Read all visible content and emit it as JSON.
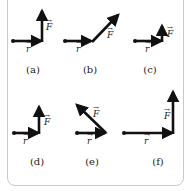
{
  "figure": {
    "colors": {
      "arrow": "#111111",
      "label": "#222222",
      "border": "#c8c8c8",
      "background": "#ffffff"
    },
    "labels": {
      "r": "r",
      "F": "F"
    },
    "panels": [
      {
        "id": "a",
        "caption": "(a)",
        "description": "F perpendicular to r, pointing up, long"
      },
      {
        "id": "b",
        "caption": "(b)",
        "description": "F at 45 degrees forward-up"
      },
      {
        "id": "c",
        "caption": "(c)",
        "description": "F perpendicular to r, short"
      },
      {
        "id": "d",
        "caption": "(d)",
        "description": "Short r, F perpendicular up"
      },
      {
        "id": "e",
        "caption": "(e)",
        "description": "F at 135 degrees, back-up"
      },
      {
        "id": "f",
        "caption": "(f)",
        "description": "Long r, long F perpendicular up"
      }
    ]
  }
}
